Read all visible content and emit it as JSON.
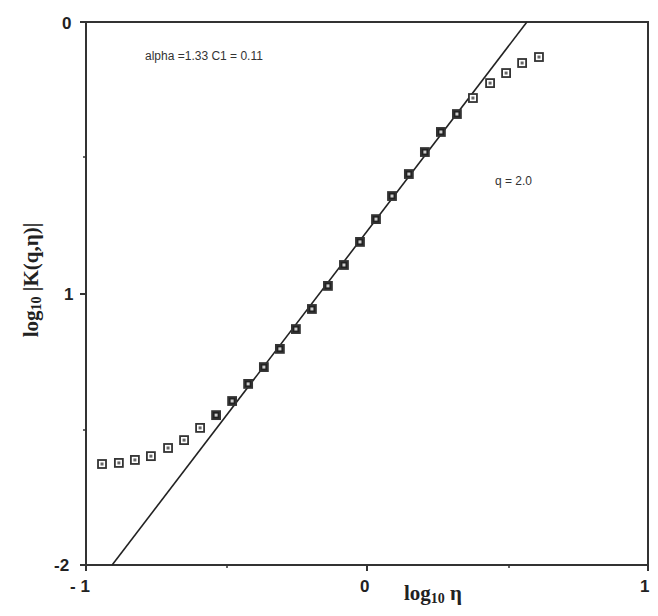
{
  "chart_data": {
    "type": "scatter",
    "title": "",
    "xlabel": "log10 η",
    "ylabel": "log10 |K(q,η)|",
    "xlim": [
      -1,
      1
    ],
    "ylim": [
      -2,
      0
    ],
    "x_ticks": [
      -1,
      0,
      1
    ],
    "x_tick_labels": [
      "- 1",
      "0",
      "1"
    ],
    "y_ticks": [
      0,
      -1,
      -2
    ],
    "y_tick_labels": [
      "0",
      "1",
      "-2"
    ],
    "grid": false,
    "legend": null,
    "annotations": [
      {
        "text": "alpha =1.33  C1  =  0.11",
        "x": -0.78,
        "y": -0.13
      },
      {
        "text": "q  =  2.0",
        "x": 0.48,
        "y": -0.58
      }
    ],
    "series": [
      {
        "name": "K(q,η) data",
        "marker": "square",
        "x": [
          -0.943,
          -0.883,
          -0.826,
          -0.769,
          -0.708,
          -0.651,
          -0.594,
          -0.537,
          -0.48,
          -0.423,
          -0.367,
          -0.31,
          -0.253,
          -0.196,
          -0.139,
          -0.082,
          -0.025,
          0.032,
          0.089,
          0.149,
          0.206,
          0.263,
          0.32,
          0.377,
          0.438,
          0.495,
          0.552,
          0.612
        ],
        "y": [
          -1.628,
          -1.624,
          -1.613,
          -1.599,
          -1.569,
          -1.54,
          -1.495,
          -1.448,
          -1.396,
          -1.333,
          -1.271,
          -1.204,
          -1.131,
          -1.057,
          -0.972,
          -0.895,
          -0.81,
          -0.726,
          -0.641,
          -0.56,
          -0.479,
          -0.405,
          -0.339,
          -0.28,
          -0.225,
          -0.188,
          -0.151,
          -0.129
        ],
        "filled": [
          false,
          false,
          false,
          false,
          false,
          false,
          false,
          true,
          true,
          true,
          true,
          true,
          true,
          true,
          true,
          true,
          true,
          true,
          true,
          true,
          true,
          true,
          true,
          false,
          false,
          false,
          false,
          false
        ]
      },
      {
        "name": "fit line",
        "type": "line",
        "x": [
          -0.907,
          0.569
        ],
        "y": [
          -2.0,
          0.0
        ]
      }
    ]
  },
  "labels": {
    "annotation_params": "alpha =1.33  C1  =  0.11",
    "annotation_q": "q  =  2.0",
    "x_title_main": "log",
    "x_title_sub": "10",
    "x_title_sym": " η",
    "y_title_main": "log",
    "y_title_sub": "10",
    "y_title_rest": " |K(q,η)|",
    "x_tick_neg1": "- 1",
    "x_tick_0": "0",
    "x_tick_1": "1",
    "y_tick_0": "0",
    "y_tick_1": "1",
    "y_tick_2": "-2"
  }
}
